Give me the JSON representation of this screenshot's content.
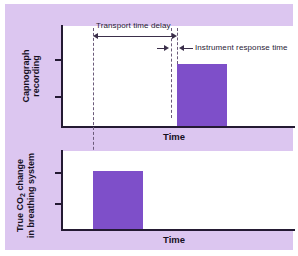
{
  "figure": {
    "background_color": "#dcc6f0",
    "plot_background": "#ffffff",
    "bar_color": "#7e4fc9",
    "axis_color": "#241a33"
  },
  "panels": [
    {
      "id": "capnograph",
      "y_axis_label_line1": "Capnograph",
      "y_axis_label_line2": "recording",
      "x_axis_label": "Time"
    },
    {
      "id": "true-co2",
      "y_axis_label_line1": "True CO",
      "y_axis_label_sub": "2",
      "y_axis_label_line1_rest": " change",
      "y_axis_label_line2": "in breathing system",
      "x_axis_label": "Time"
    }
  ],
  "annotations": {
    "transport_time_delay": "Transport time delay",
    "instrument_response_time": "Instrument response time"
  },
  "chart_data": {
    "type": "bar",
    "title": "",
    "xlabel": "Time",
    "ylabel": "",
    "grid": false,
    "legend": "none",
    "series": [
      {
        "name": "Capnograph recording",
        "panel": "top",
        "bar_start": 0.495,
        "bar_end": 0.71,
        "bar_height": 0.62,
        "note": "Delayed and attenuated step response"
      },
      {
        "name": "True CO2 change in breathing system",
        "panel": "bottom",
        "bar_start": 0.133,
        "bar_end": 0.348,
        "bar_height": 0.74,
        "note": "Actual square-wave step in breathing system"
      }
    ],
    "markers": {
      "true_step_onset": 0.133,
      "capnograph_response_start": 0.472,
      "capnograph_plateau_reached": 0.495
    },
    "intervals": [
      {
        "label": "Transport time delay",
        "from": 0.133,
        "to": 0.495
      },
      {
        "label": "Instrument response time",
        "from": 0.472,
        "to": 0.495
      }
    ]
  }
}
